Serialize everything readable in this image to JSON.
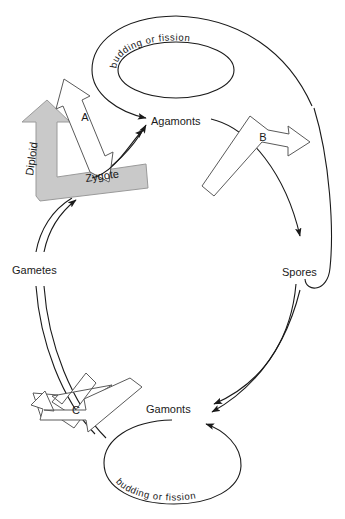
{
  "diagram": {
    "type": "life-cycle-diagram",
    "background_color": "#ffffff",
    "line_color": "#1a1a1a",
    "diploid_arrow_color": "#c9c9c9",
    "block_arrow_fill": "#ffffff",
    "block_arrow_stroke": "#5a5a5a"
  },
  "stages": {
    "agamonts": "Agamonts",
    "spores": "Spores",
    "gamonts": "Gamonts",
    "gametes": "Gametes",
    "zygote": "Zygote"
  },
  "asexual_loops": {
    "top": "budding or fission",
    "bottom": "budding or fission"
  },
  "phases": {
    "diploid": "Diploid"
  },
  "transitions": {
    "a": "A",
    "b": "B",
    "c": "C"
  }
}
